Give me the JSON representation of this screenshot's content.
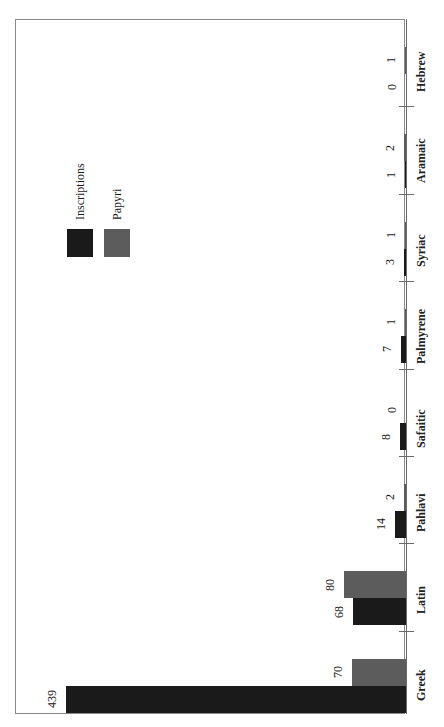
{
  "chart_data": {
    "type": "bar",
    "orientation": "horizontal (rendered rotated 90°, bars grow leftward from baseline)",
    "title": "",
    "xlabel": "",
    "ylabel": "",
    "categories": [
      "Hebrew",
      "Aramaic",
      "Syriac",
      "Palmyrene",
      "Safaitic",
      "Pahlavi",
      "Latin",
      "Greek"
    ],
    "series": [
      {
        "name": "Inscriptions",
        "color": "#1a1a1a",
        "values": [
          0,
          1,
          3,
          7,
          8,
          14,
          68,
          439
        ]
      },
      {
        "name": "Papyri",
        "color": "#5c5c5c",
        "values": [
          1,
          2,
          1,
          1,
          0,
          2,
          80,
          70
        ]
      }
    ],
    "data_labels": true,
    "grid": false,
    "legend": {
      "position": "upper-left (rotated)",
      "entries": [
        "Inscriptions",
        "Papyri"
      ]
    },
    "value_range": [
      0,
      439
    ]
  },
  "layout": {
    "baseline_x": 406,
    "px_per_unit": 0.775,
    "first_group_top": 19,
    "group_height": 87.4,
    "bar_thickness": 27
  }
}
